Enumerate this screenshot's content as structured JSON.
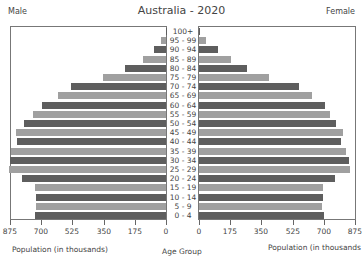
{
  "header": {
    "title": "Australia - 2020",
    "left_label": "Male",
    "right_label": "Female"
  },
  "axes": {
    "left_title": "Population (in thousands)",
    "center_title": "Age Group",
    "right_title": "Population (in thousands"
  },
  "colors": {
    "dark": "#5e5e5e",
    "light": "#a0a0a0",
    "frame": "#777777"
  },
  "chart_data": {
    "type": "bar",
    "subtype": "population-pyramid",
    "title": "Australia - 2020",
    "categories": [
      "100+",
      "95 - 99",
      "90 - 94",
      "85 - 89",
      "80 - 84",
      "75 - 79",
      "70 - 74",
      "65 - 69",
      "60 - 64",
      "55 - 59",
      "50 - 54",
      "45 - 49",
      "40 - 44",
      "35 - 39",
      "30 - 34",
      "25 - 29",
      "20 - 24",
      "15 - 19",
      "10 - 14",
      "5 - 9",
      "0 - 4"
    ],
    "series": [
      {
        "name": "Male",
        "values": [
          2,
          28,
          68,
          130,
          232,
          356,
          531,
          604,
          695,
          746,
          797,
          840,
          836,
          870,
          876,
          881,
          808,
          734,
          729,
          729,
          734
        ]
      },
      {
        "name": "Female",
        "values": [
          6,
          40,
          107,
          181,
          271,
          390,
          559,
          633,
          706,
          734,
          768,
          808,
          796,
          825,
          842,
          847,
          763,
          695,
          695,
          689,
          701
        ]
      }
    ],
    "xlabel": "Population (in thousands)",
    "ylabel": "Age Group",
    "xticks": [
      875,
      700,
      525,
      350,
      175,
      0
    ],
    "xlim": [
      0,
      875
    ],
    "legend": {
      "left": "Male",
      "right": "Female"
    },
    "grid": false
  }
}
